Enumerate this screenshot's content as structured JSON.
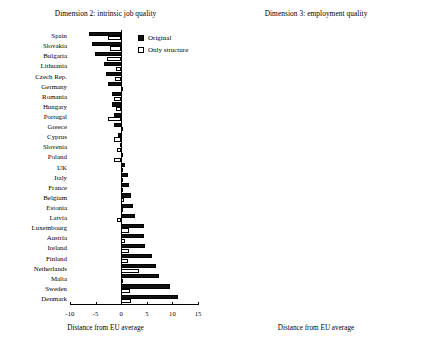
{
  "figure": {
    "width": 421,
    "height": 350,
    "background": "#ffffff",
    "series_colors": {
      "original": "#111111",
      "only_structure": "#ffffff",
      "outline": "#000000"
    }
  },
  "legend": {
    "original_label": "Original",
    "structure_label": "Only structure",
    "original_icon": "filled-square-icon",
    "structure_icon": "hollow-square-icon"
  },
  "chart_data": [
    {
      "id": "dimension2",
      "type": "bar",
      "orientation": "horizontal",
      "title": "Dimension 2: intrinsic job quality",
      "xlabel": "Distance from EU average",
      "ylabel": "",
      "xlim": [
        -10,
        15
      ],
      "xticks": [
        -10,
        -5,
        0,
        5,
        10,
        15
      ],
      "xticklabels": [
        "-10",
        "-5",
        "0",
        "5",
        "10",
        "15"
      ],
      "grid": false,
      "legend_position": "top-right",
      "categories": [
        "Spain",
        "Slovakia",
        "Bulgaria",
        "Lithuania",
        "Czech Rep.",
        "Germany",
        "Romania",
        "Hungary",
        "Portugal",
        "Greece",
        "Cyprus",
        "Slovenia",
        "Poland",
        "UK",
        "Italy",
        "France",
        "Belgium",
        "Estonia",
        "Latvia",
        "Luxembourg",
        "Austria",
        "Ireland",
        "Finland",
        "Netherlands",
        "Malta",
        "Sweden",
        "Denmark"
      ],
      "series": [
        {
          "name": "Original",
          "values": [
            -6.3,
            -5.8,
            -5.2,
            -3.3,
            -3.0,
            -2.6,
            -1.8,
            -1.7,
            -1.5,
            -1.4,
            -0.6,
            -0.2,
            0.3,
            0.8,
            1.4,
            1.6,
            2.0,
            2.4,
            2.7,
            4.4,
            4.5,
            4.7,
            6.0,
            6.8,
            7.4,
            9.5,
            11.0
          ]
        },
        {
          "name": "Only structure",
          "values": [
            -2.5,
            -2.2,
            -2.7,
            -1.0,
            -1.2,
            0.2,
            -1.5,
            -1.0,
            -2.5,
            0.2,
            -1.4,
            -0.9,
            -1.4,
            -0.1,
            0.3,
            0.1,
            0.6,
            0.3,
            -0.9,
            1.5,
            0.8,
            1.6,
            1.3,
            3.4,
            0.1,
            1.7,
            1.9
          ]
        }
      ]
    },
    {
      "id": "dimension3",
      "type": "bar",
      "orientation": "horizontal",
      "title": "Dimension 3: employment quality",
      "xlabel": "Distance from EU average",
      "ylabel": "",
      "xlim": [
        -15,
        15
      ],
      "xticks": [
        -15,
        -10,
        -5,
        0,
        5,
        10,
        15
      ],
      "xticklabels": [
        "-15",
        "-10",
        "-5",
        "0",
        "5",
        "10",
        "15"
      ],
      "grid": false,
      "legend_position": "top-right",
      "categories": [
        "Bulgaria",
        "Greece",
        "Cyprus",
        "Romania",
        "Hungary",
        "Czech Rep.",
        "Poland",
        "Spain",
        "Portugal",
        "Lithuania",
        "Italy",
        "Latvia",
        "Malta",
        "Estonia",
        "Slovenia",
        "Slovakia",
        "Ireland",
        "Germany",
        "Netherlands",
        "France",
        "Austria",
        "UK",
        "Sweden",
        "Denmark",
        "Belgium",
        "Luxembourg",
        "Finland"
      ],
      "series": [
        {
          "name": "Original",
          "values": [
            -11.0,
            -10.0,
            -9.2,
            -8.0,
            -6.6,
            -6.2,
            -5.0,
            -4.5,
            -4.2,
            -4.0,
            -3.2,
            -2.4,
            -1.6,
            -1.3,
            -0.2,
            0.0,
            0.4,
            1.6,
            2.4,
            3.6,
            4.6,
            4.6,
            6.2,
            6.4,
            6.6,
            8.0,
            8.4
          ]
        },
        {
          "name": "Only structure",
          "values": [
            -1.2,
            -1.8,
            -0.4,
            -1.0,
            -0.7,
            -1.4,
            0.0,
            -1.5,
            -1.0,
            -0.3,
            0.2,
            -0.7,
            0.7,
            0.1,
            0.4,
            0.3,
            -0.2,
            0.3,
            0.4,
            0.8,
            0.6,
            1.4,
            1.6,
            1.0,
            1.8,
            1.2,
            1.5
          ]
        }
      ]
    }
  ]
}
